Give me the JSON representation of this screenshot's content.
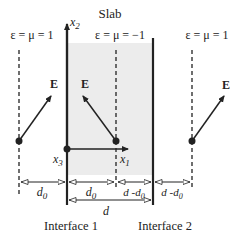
{
  "diagram": {
    "title": "Slab",
    "regions": [
      {
        "name": "left-medium",
        "label": "ε = μ = 1"
      },
      {
        "name": "slab",
        "label": "ε = μ = −1"
      },
      {
        "name": "right-medium",
        "label": "ε = μ = 1"
      }
    ],
    "axes": {
      "x1": "x",
      "x1_sub": "1",
      "x2": "x",
      "x2_sub": "2",
      "x3": "x",
      "x3_sub": "3"
    },
    "field_label": "E",
    "dimensions": {
      "d0_main": "d",
      "d0_sub": "0",
      "d_minus_d0_main": "d -d",
      "d_minus_d0_sub": "0",
      "d": "d"
    },
    "interfaces": [
      "Interface 1",
      "Interface 2"
    ],
    "colors": {
      "slab_fill": "#ececec",
      "lines": "#222222"
    }
  }
}
